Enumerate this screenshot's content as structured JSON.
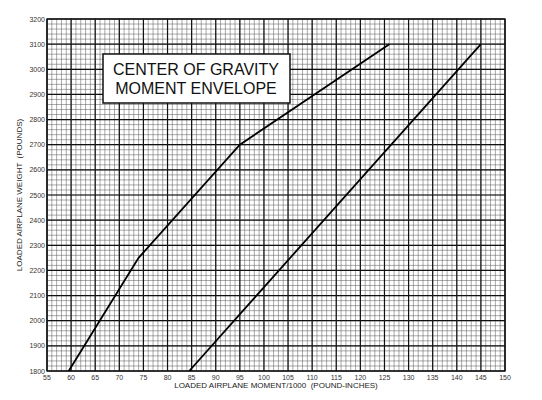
{
  "chart_data": {
    "type": "line",
    "title": "CENTER OF GRAVITY MOMENT ENVELOPE",
    "title_lines": [
      "CENTER OF GRAVITY",
      "MOMENT ENVELOPE"
    ],
    "xlabel": "LOADED AIRPLANE MOMENT/1000  (POUND-INCHES)",
    "ylabel": "LOADED AIRPLANE WEIGHT  (POUNDS)",
    "xlim": [
      55,
      150
    ],
    "ylim": [
      1800,
      3200
    ],
    "x_ticks": [
      55,
      60,
      65,
      70,
      75,
      80,
      85,
      90,
      95,
      100,
      105,
      110,
      115,
      120,
      125,
      130,
      135,
      140,
      145,
      150
    ],
    "y_ticks": [
      1800,
      1900,
      2000,
      2100,
      2200,
      2300,
      2400,
      2500,
      2600,
      2700,
      2800,
      2900,
      3000,
      3100,
      3200
    ],
    "grid": true,
    "minor_divisions": 5,
    "legend": null,
    "series": [
      {
        "name": "forward limit",
        "x": [
          59.5,
          74,
          95,
          126
        ],
        "y": [
          1800,
          2250,
          2700,
          3100
        ]
      },
      {
        "name": "aft limit",
        "x": [
          84.5,
          145
        ],
        "y": [
          1800,
          3100
        ]
      }
    ]
  }
}
